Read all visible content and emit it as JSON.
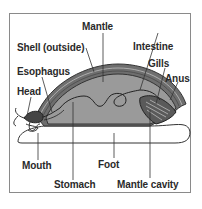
{
  "diagram": {
    "labels": {
      "mantle": "Mantle",
      "shell": "Shell (outside)",
      "esophagus": "Esophagus",
      "head": "Head",
      "intestine": "Intestine",
      "gills": "Gills",
      "anus": "Anus",
      "mouth": "Mouth",
      "stomach": "Stomach",
      "foot": "Foot",
      "mantle_cavity": "Mantle cavity"
    },
    "colors": {
      "visceral_mass": "#9a9a9a",
      "shell": "#6e6e6e",
      "outline": "#333333",
      "foot": "#ffffff",
      "frame": "#8a8a8a"
    }
  }
}
